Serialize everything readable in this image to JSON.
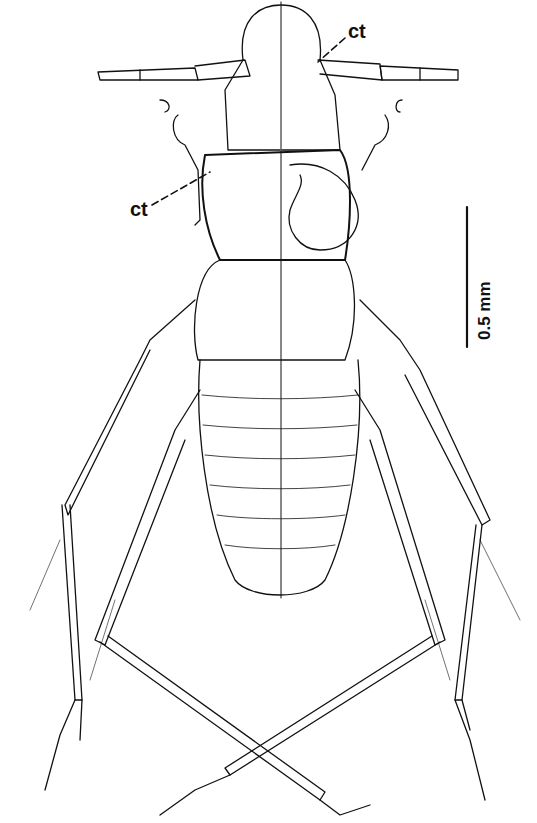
{
  "figure": {
    "labels": [
      {
        "text": "ct",
        "position": "upper-right near head"
      },
      {
        "text": "ct",
        "position": "left near pronotum"
      }
    ],
    "scale_bar": {
      "value": "0.5",
      "unit": "mm",
      "text": "0.5  mm"
    },
    "colors": {
      "background": "#ffffff",
      "ink": "#111111"
    }
  }
}
